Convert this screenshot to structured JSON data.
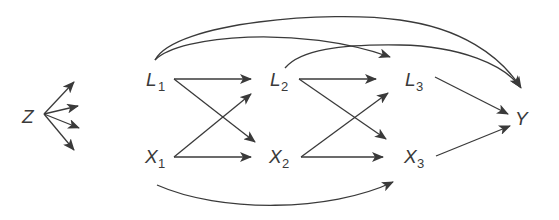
{
  "diagram": {
    "type": "causal-dag",
    "nodes": [
      {
        "id": "Z",
        "label": "Z",
        "sub": ""
      },
      {
        "id": "L1",
        "label": "L",
        "sub": "1"
      },
      {
        "id": "X1",
        "label": "X",
        "sub": "1"
      },
      {
        "id": "L2",
        "label": "L",
        "sub": "2"
      },
      {
        "id": "X2",
        "label": "X",
        "sub": "2"
      },
      {
        "id": "L3",
        "label": "L",
        "sub": "3"
      },
      {
        "id": "X3",
        "label": "X",
        "sub": "3"
      },
      {
        "id": "Y",
        "label": "Y",
        "sub": ""
      }
    ],
    "edges": [
      {
        "from": "Z",
        "to": "(unlabeled)",
        "count": 4
      },
      {
        "from": "L1",
        "to": "L2"
      },
      {
        "from": "L1",
        "to": "X2"
      },
      {
        "from": "X1",
        "to": "L2"
      },
      {
        "from": "X1",
        "to": "X2"
      },
      {
        "from": "L2",
        "to": "L3"
      },
      {
        "from": "L2",
        "to": "X3"
      },
      {
        "from": "X2",
        "to": "L3"
      },
      {
        "from": "X2",
        "to": "X3"
      },
      {
        "from": "L3",
        "to": "Y"
      },
      {
        "from": "X3",
        "to": "Y"
      },
      {
        "from": "L1",
        "to": "L3",
        "curved": true
      },
      {
        "from": "L1",
        "to": "Y",
        "curved": true
      },
      {
        "from": "L2",
        "to": "Y",
        "curved": true
      },
      {
        "from": "X1",
        "to": "X3",
        "curved": true
      }
    ],
    "colors": {
      "ink": "#3a3a3a",
      "background": "#ffffff"
    }
  }
}
